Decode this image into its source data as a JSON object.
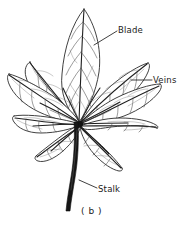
{
  "figure": {
    "caption": "( b )",
    "background_color": "#ffffff",
    "ink_color": "#1f1f1f",
    "width": 183,
    "height": 225
  },
  "annotations": [
    {
      "id": "blade",
      "label": "Blade",
      "leader_from": [
        117,
        31
      ],
      "leader_to": [
        94,
        45
      ],
      "target": "central-leaflet-lamina"
    },
    {
      "id": "veins",
      "label": "Veins",
      "leader_from": [
        152,
        80
      ],
      "leader_to": [
        131,
        80
      ],
      "target": "upper-right-leaflet-venation"
    },
    {
      "id": "stalk",
      "label": "Stalk",
      "leader_from": [
        97,
        188
      ],
      "leader_to": [
        79,
        180
      ],
      "target": "petiole"
    }
  ],
  "structure": {
    "type": "palmate",
    "center_point": [
      80,
      123
    ],
    "leaflet_count": 9,
    "leaflets": [
      {
        "name": "leaflet-top-center",
        "tip": [
          84,
          9
        ],
        "length": 114,
        "angle_deg": -88
      },
      {
        "name": "leaflet-upper-left",
        "tip": [
          30,
          62
        ],
        "length": 78,
        "angle_deg": -132
      },
      {
        "name": "leaflet-upper-right",
        "tip": [
          148,
          63
        ],
        "length": 86,
        "angle_deg": -40
      },
      {
        "name": "leaflet-left",
        "tip": [
          9,
          74
        ],
        "length": 87,
        "angle_deg": -150
      },
      {
        "name": "leaflet-right",
        "tip": [
          160,
          84
        ],
        "length": 89,
        "angle_deg": -25
      },
      {
        "name": "leaflet-lower-left",
        "tip": [
          14,
          116
        ],
        "length": 67,
        "angle_deg": -174
      },
      {
        "name": "leaflet-lower-right",
        "tip": [
          157,
          128
        ],
        "length": 77,
        "angle_deg": 4
      },
      {
        "name": "leaflet-bottom-left",
        "tip": [
          36,
          156
        ],
        "length": 55,
        "angle_deg": 143
      },
      {
        "name": "leaflet-bottom-right",
        "tip": [
          122,
          168
        ],
        "length": 58,
        "angle_deg": 48
      }
    ],
    "stalk": {
      "name": "petiole",
      "top": [
        80,
        123
      ],
      "bottom": [
        69,
        211
      ],
      "thickness_top": 4,
      "thickness_bottom": 3
    }
  }
}
